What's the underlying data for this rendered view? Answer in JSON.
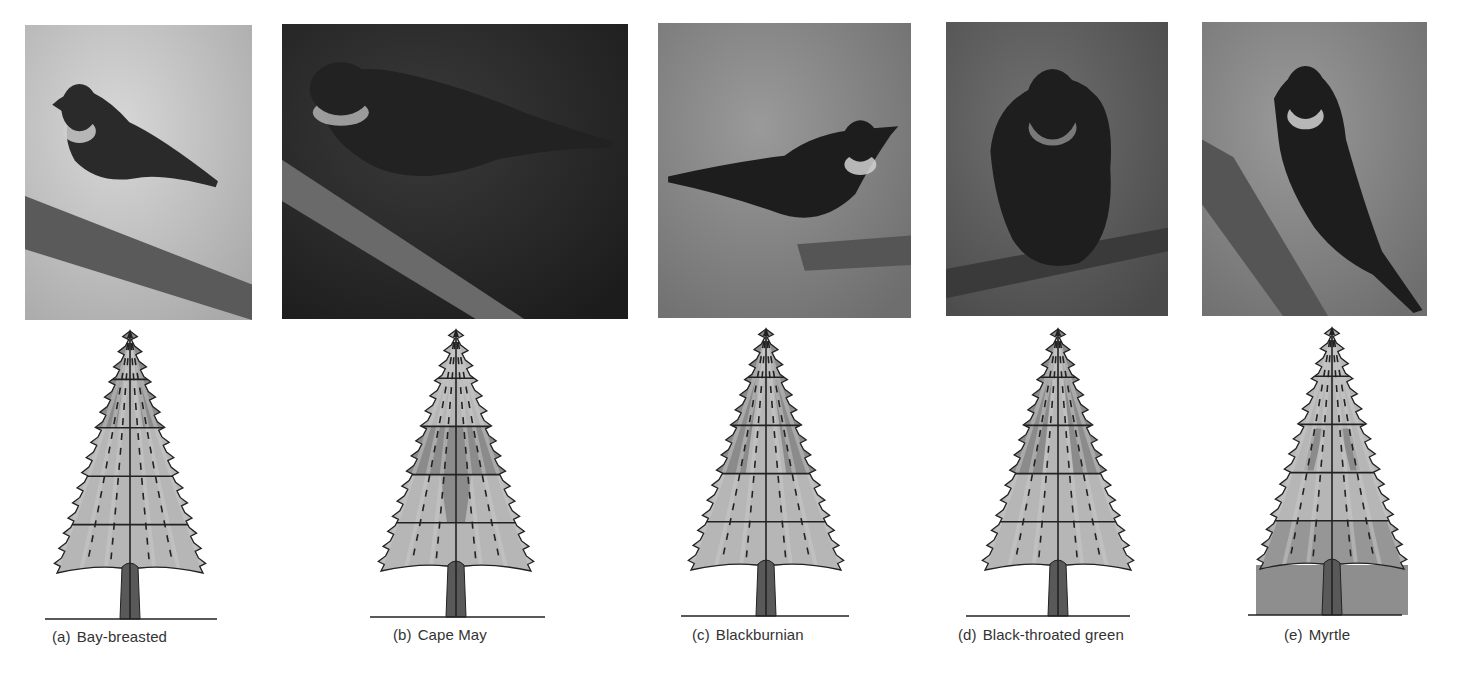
{
  "figure": {
    "panels": [
      {
        "id": "a",
        "letter": "(a)",
        "species": "Bay-breasted",
        "photo": {
          "x": 25,
          "y": 25,
          "w": 227,
          "h": 295,
          "tone": "light"
        },
        "tree": {
          "cx": 130,
          "tip": 331,
          "base": 573,
          "ground": 619,
          "ground_x1": 45,
          "ground_x2": 217,
          "half_w": 73,
          "box": false
        },
        "feeding_zone": "middle-upper outer branches",
        "label_x": 52
      },
      {
        "id": "b",
        "letter": "(b)",
        "species": "Cape May",
        "photo": {
          "x": 282,
          "y": 24,
          "w": 346,
          "h": 295,
          "tone": "dark"
        },
        "tree": {
          "cx": 456,
          "tip": 330,
          "base": 571,
          "ground": 617,
          "ground_x1": 370,
          "ground_x2": 545,
          "half_w": 75,
          "box": false
        },
        "feeding_zone": "upper-middle band, full width, plus inner wedge below",
        "label_x": 393
      },
      {
        "id": "c",
        "letter": "(c)",
        "species": "Blackburnian",
        "photo": {
          "x": 658,
          "y": 23,
          "w": 253,
          "h": 295,
          "tone": "mid"
        },
        "tree": {
          "cx": 766,
          "tip": 329,
          "base": 570,
          "ground": 616,
          "ground_x1": 681,
          "ground_x2": 849,
          "half_w": 75,
          "box": false
        },
        "feeding_zone": "top outer branches",
        "label_x": 692
      },
      {
        "id": "d",
        "letter": "(d)",
        "species": "Black-throated green",
        "photo": {
          "x": 946,
          "y": 22,
          "w": 222,
          "h": 294,
          "tone": "mid-dark"
        },
        "tree": {
          "cx": 1058,
          "tip": 329,
          "base": 570,
          "ground": 616,
          "ground_x1": 966,
          "ground_x2": 1130,
          "half_w": 73,
          "box": false
        },
        "feeding_zone": "top and upper-middle outer branches",
        "label_x": 958
      },
      {
        "id": "e",
        "letter": "(e)",
        "species": "Myrtle",
        "photo": {
          "x": 1202,
          "y": 22,
          "w": 225,
          "h": 294,
          "tone": "mid"
        },
        "tree": {
          "cx": 1332,
          "tip": 328,
          "base": 569,
          "ground": 615,
          "ground_x1": 1248,
          "ground_x2": 1402,
          "half_w": 72,
          "box": true
        },
        "feeding_zone": "lower branches and ground",
        "label_x": 1284
      }
    ],
    "colors": {
      "tree_light": "#b6b6b6",
      "tree_highlight": "#c9c9c9",
      "tree_dark": "#8b8b8b",
      "outline": "#222222",
      "trunk": "#595959",
      "ground_box": "#8e8e8e",
      "label_text": "#333333"
    }
  }
}
